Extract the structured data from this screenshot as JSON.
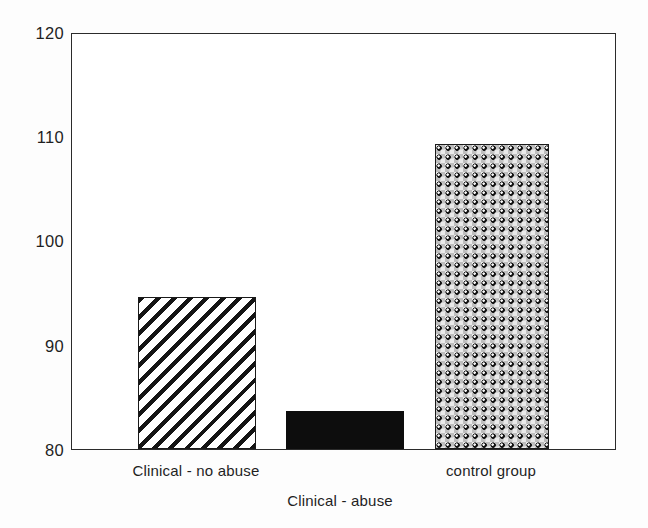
{
  "chart_data": {
    "type": "bar",
    "title": "",
    "subtitle": "",
    "xlabel": "",
    "ylabel": "",
    "categories": [
      "Clinical - no abuse",
      "Clinical - abuse",
      "control group"
    ],
    "values": [
      94.7,
      83.7,
      109.4
    ],
    "series": [
      {
        "name": "",
        "values": [
          94.7,
          83.7,
          109.4
        ]
      }
    ],
    "ylim": [
      80,
      120
    ],
    "yticks": [
      80,
      90,
      100,
      110,
      120
    ],
    "ytick_labels": [
      "80",
      "90",
      "100",
      "110",
      "120"
    ],
    "xtick_labels": [
      "Clinical - no abuse",
      "Clinical - abuse",
      "control group"
    ],
    "grid": false,
    "legend": null,
    "legend_position": "none",
    "bar_fills": [
      "diagonal-hatch",
      "solid-black",
      "dot-sphere"
    ],
    "annotations": [],
    "colors": {
      "axis": "#2b2b2b",
      "bar_outline": "#1a1a1a",
      "solid_bar": "#0d0d0d",
      "background": "#fdfdfd",
      "plot_background": "#ffffff",
      "text": "#1f1f1f"
    }
  },
  "axis": {
    "y_ticks": [
      {
        "label": "120",
        "value": 120
      },
      {
        "label": "110",
        "value": 110
      },
      {
        "label": "100",
        "value": 100
      },
      {
        "label": "90",
        "value": 90
      },
      {
        "label": "80",
        "value": 80
      }
    ]
  },
  "bars": [
    {
      "label": "Clinical - no abuse",
      "value": 94.7,
      "fill": "diagonal-hatch"
    },
    {
      "label": "Clinical - abuse",
      "value": 83.7,
      "fill": "solid-black"
    },
    {
      "label": "control group",
      "value": 109.4,
      "fill": "dot-sphere"
    }
  ],
  "category_labels": {
    "first": "Clinical - no abuse",
    "second": "Clinical - abuse",
    "third": "control group"
  }
}
